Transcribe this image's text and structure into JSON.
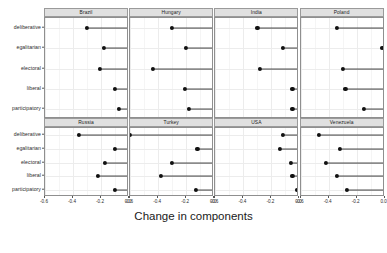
{
  "chart_data": {
    "type": "scatter",
    "title": "",
    "xlabel": "Change in components",
    "ylabel": "",
    "xlim": [
      -0.6,
      0.0
    ],
    "xticks": [
      -0.6,
      -0.4,
      -0.2,
      0.0
    ],
    "xticklabels": [
      "-0.6",
      "-0.4",
      "-0.2",
      "0.0"
    ],
    "categories": [
      "deliberative",
      "egalitarian",
      "electoral",
      "liberal",
      "participatory"
    ],
    "grid": true,
    "legend": null,
    "facet_layout": [
      2,
      4
    ],
    "panels": [
      {
        "name": "Brazil",
        "values": [
          -0.3,
          -0.18,
          -0.21,
          -0.1,
          -0.07
        ]
      },
      {
        "name": "Hungary",
        "values": [
          -0.3,
          -0.2,
          -0.44,
          -0.21,
          -0.18
        ]
      },
      {
        "name": "India",
        "values": [
          -0.3,
          -0.12,
          -0.28,
          -0.05,
          -0.05
        ]
      },
      {
        "name": "Poland",
        "values": [
          -0.34,
          -0.02,
          -0.3,
          -0.28,
          -0.15
        ]
      },
      {
        "name": "Russia",
        "values": [
          -0.36,
          -0.1,
          -0.17,
          -0.22,
          -0.1
        ]
      },
      {
        "name": "Turkey",
        "values": [
          -0.6,
          -0.12,
          -0.3,
          -0.38,
          -0.13
        ]
      },
      {
        "name": "USA",
        "values": [
          -0.12,
          -0.14,
          -0.06,
          -0.05,
          -0.02
        ]
      },
      {
        "name": "Venezuela",
        "values": [
          -0.47,
          -0.32,
          -0.42,
          -0.34,
          -0.27
        ]
      }
    ]
  }
}
